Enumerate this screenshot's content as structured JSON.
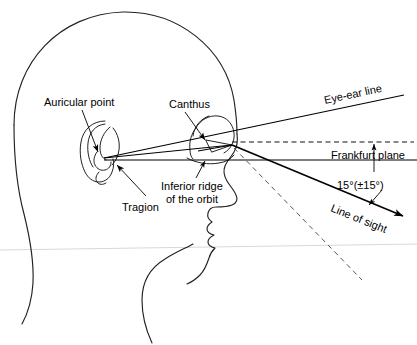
{
  "figure": {
    "background_color": "#ffffff",
    "line_color": "#1a1a1a"
  },
  "labels": {
    "auricular_point": "Auricular point",
    "canthus": "Canthus",
    "tragion": "Tragion",
    "inferior_ridge_line1": "Inferior ridge",
    "inferior_ridge_line2": "of the orbit",
    "eye_ear_line": "Eye-ear line",
    "frankfurt_plane": "Frankfurt plane",
    "line_of_sight": "Line of sight",
    "angle": "15°(±15°)"
  },
  "annotations": {
    "angle_value": "15°",
    "angle_tolerance": "±15°",
    "convergence_point": {
      "x": 232,
      "y": 145
    },
    "tragion_point": {
      "x": 104,
      "y": 158
    }
  }
}
